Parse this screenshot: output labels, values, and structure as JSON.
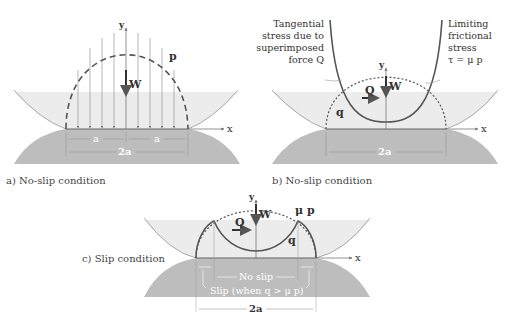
{
  "panels": {
    "a": {
      "caption": "a) No-slip condition",
      "labels": {
        "y": "y",
        "x": "x",
        "p": "p",
        "W": "W",
        "a_left": "a",
        "a_right": "a",
        "width": "2a"
      }
    },
    "b": {
      "caption": "b) No-slip condition",
      "labels": {
        "y": "y",
        "x": "x",
        "W": "W",
        "Q": "Q",
        "q": "q",
        "width": "2a"
      },
      "annotation_left": [
        "Tangential",
        "stress due to",
        "superimposed",
        "force Q"
      ],
      "annotation_right": [
        "Limiting",
        "frictional",
        "stress",
        "τ = μ p"
      ]
    },
    "c": {
      "caption": "c) Slip condition",
      "labels": {
        "y": "y",
        "x": "x",
        "W": "W",
        "Q": "Q",
        "q": "q",
        "mu_p": "μ p",
        "width": "2a",
        "no_slip": "No slip",
        "slip": "Slip (when q > μ p)"
      }
    }
  },
  "colors": {
    "upper_body": "#ececec",
    "lower_body": "#bdbdbd",
    "curve": "#555555",
    "line": "#777777"
  }
}
